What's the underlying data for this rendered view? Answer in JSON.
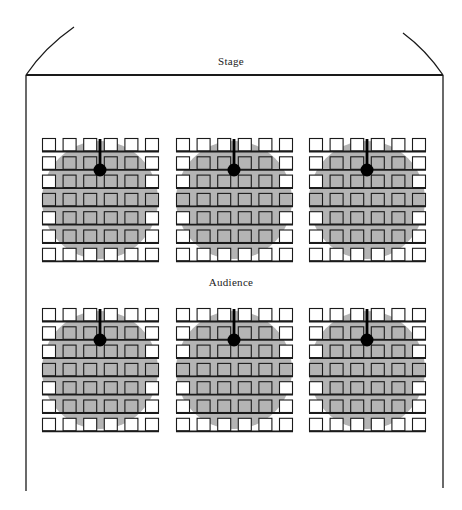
{
  "diagram": {
    "title_labels": {
      "stage": "Stage",
      "audience": "Audience"
    },
    "colors": {
      "line": "#1a1a1a",
      "coverage": "#b4b4b4",
      "seat_fill": "#ffffff",
      "speaker": "#000000"
    },
    "layout": {
      "seat_columns": 6,
      "seat_rows": 7,
      "blocks_per_row": 3,
      "block_rows": 2
    },
    "blocks": [
      {
        "id": "top-left",
        "x": 42,
        "y": 138,
        "label": "Seating section with speaker 1"
      },
      {
        "id": "top-center",
        "x": 176,
        "y": 138,
        "label": "Seating section with speaker 2"
      },
      {
        "id": "top-right",
        "x": 309,
        "y": 138,
        "label": "Seating section with speaker 3"
      },
      {
        "id": "bottom-left",
        "x": 42,
        "y": 308,
        "label": "Seating section with speaker 4"
      },
      {
        "id": "bottom-center",
        "x": 176,
        "y": 308,
        "label": "Seating section with speaker 5"
      },
      {
        "id": "bottom-right",
        "x": 309,
        "y": 308,
        "label": "Seating section with speaker 6"
      }
    ]
  }
}
